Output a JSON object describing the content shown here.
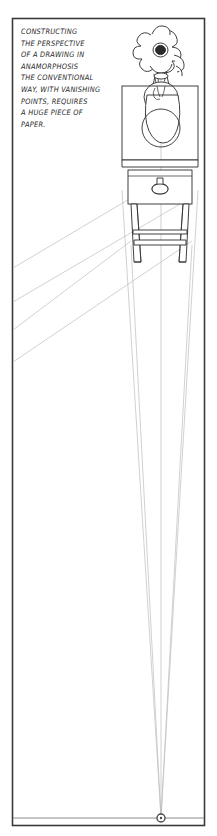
{
  "panel": {
    "title": "Anamorphosis perspective illustration panel",
    "background_color": "#ffffff",
    "border_color": "#3a3a3a",
    "ink_color": "#2b2b2b",
    "construction_line_color": "#b9b9b9",
    "frame": {
      "x": 12,
      "y": 18,
      "width": 193,
      "height": 808
    }
  },
  "caption": {
    "name": "panel-caption",
    "lines": [
      "CONSTRUCTING",
      "THE PERSPECTIVE",
      "OF A DRAWING IN",
      "ANAMORPHOSIS",
      "THE CONVENTIONAL",
      "WAY, WITH VANISHING",
      "POINTS, REQUIRES",
      "A HUGE PIECE OF",
      "PAPER."
    ],
    "full_text": "CONSTRUCTING THE PERSPECTIVE OF A DRAWING IN ANAMORPHOSIS THE CONVENTIONAL WAY, WITH VANISHING POINTS, REQUIRES A HUGE PIECE OF PAPER."
  },
  "illustration": {
    "name": "flower-vase-on-table-perspective-drawing",
    "subject": "flower in a vase standing on a table, drawn in one-point perspective",
    "elements": [
      {
        "name": "flower",
        "petal_count": 9,
        "center_color": "#2b2b2b"
      },
      {
        "name": "vase",
        "shape": "round-bodied vase with narrow neck"
      },
      {
        "name": "tabletop-box",
        "shape": "rectangular box in perspective"
      },
      {
        "name": "table-apron",
        "shape": "rectangular band with knob"
      },
      {
        "name": "drawer-knob",
        "shape": "small round knob"
      },
      {
        "name": "table-legs",
        "count": 2,
        "shape": "tapering vertical legs"
      },
      {
        "name": "leg-stretchers",
        "count": 2,
        "shape": "horizontal rails"
      }
    ]
  },
  "perspective": {
    "name": "perspective-construction",
    "vanishing_point": {
      "label": "vanishing point",
      "x": 161,
      "y": 818,
      "marker": "small circle"
    },
    "horizon_line": {
      "y": 818,
      "x_start": 12,
      "x_end": 205
    },
    "receding_lines_count": 3,
    "diagonal_lines_count": 2,
    "diagonal_direction": "toward off-panel vanishing point at upper left"
  }
}
